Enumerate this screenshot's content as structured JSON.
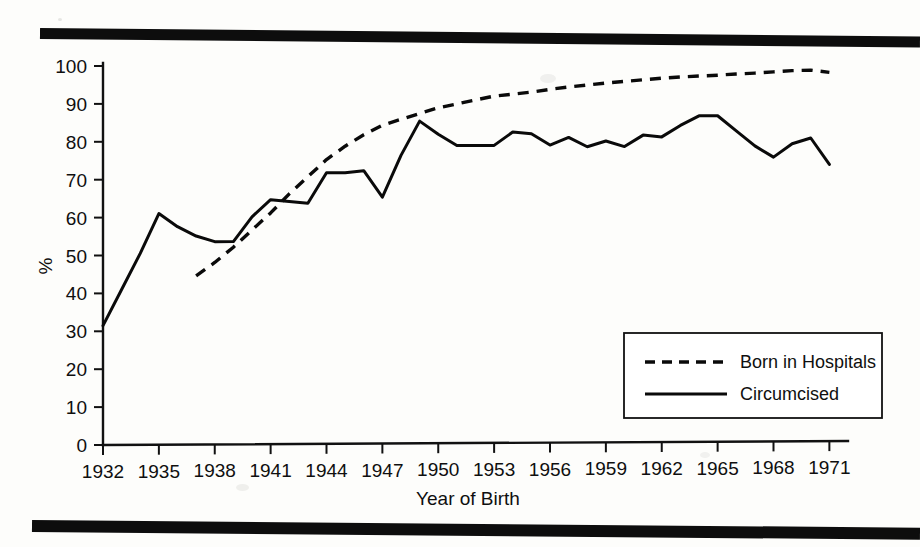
{
  "figure": {
    "background_color": "#fdfdfb",
    "ink_color": "#0a0a0a",
    "percent_symbol": "%",
    "top_rule": "scan-rule",
    "bottom_rule": "scan-rule"
  },
  "chart_data": {
    "type": "line",
    "title": "",
    "xlabel": "Year of Birth",
    "ylabel": "%",
    "xlim": [
      1932,
      1972
    ],
    "ylim": [
      0,
      100
    ],
    "grid": false,
    "legend_position": "lower-right-inside",
    "x_ticks": [
      1932,
      1935,
      1938,
      1941,
      1944,
      1947,
      1950,
      1953,
      1956,
      1959,
      1962,
      1965,
      1968,
      1971
    ],
    "y_ticks": [
      0,
      10,
      20,
      30,
      40,
      50,
      60,
      70,
      80,
      90,
      100
    ],
    "series": [
      {
        "name": "Born in Hospitals",
        "style": "dashed",
        "x": [
          1937,
          1938,
          1939,
          1940,
          1941,
          1942,
          1943,
          1944,
          1945,
          1946,
          1947,
          1948,
          1949,
          1950,
          1951,
          1952,
          1953,
          1954,
          1955,
          1956,
          1957,
          1958,
          1959,
          1960,
          1961,
          1962,
          1963,
          1964,
          1965,
          1966,
          1967,
          1968,
          1969,
          1970,
          1971
        ],
        "values": [
          44.5,
          48.0,
          52.0,
          56.5,
          61.0,
          66.0,
          70.5,
          75.0,
          78.5,
          81.5,
          84.0,
          85.5,
          87.0,
          88.5,
          89.5,
          90.5,
          91.5,
          92.0,
          92.5,
          93.2,
          93.8,
          94.3,
          94.8,
          95.2,
          95.6,
          96.0,
          96.3,
          96.5,
          96.7,
          97.0,
          97.2,
          97.5,
          97.8,
          97.9,
          97.3
        ]
      },
      {
        "name": "Circumcised",
        "style": "solid",
        "x": [
          1932,
          1933,
          1934,
          1935,
          1936,
          1937,
          1938,
          1939,
          1940,
          1941,
          1942,
          1943,
          1944,
          1945,
          1946,
          1947,
          1948,
          1949,
          1950,
          1951,
          1952,
          1953,
          1954,
          1955,
          1956,
          1957,
          1958,
          1959,
          1960,
          1961,
          1962,
          1963,
          1964,
          1965,
          1966,
          1967,
          1968,
          1969,
          1970,
          1971
        ],
        "values": [
          31.5,
          41.0,
          50.5,
          61.0,
          57.5,
          55.0,
          53.5,
          53.5,
          60.0,
          64.5,
          64.0,
          63.5,
          71.5,
          71.5,
          72.0,
          65.0,
          76.0,
          85.0,
          81.5,
          78.5,
          78.5,
          78.5,
          82.0,
          81.5,
          78.5,
          80.5,
          78.0,
          79.5,
          78.0,
          81.0,
          80.5,
          83.5,
          86.0,
          86.0,
          82.0,
          78.0,
          75.0,
          78.5,
          80.0,
          73.0
        ]
      }
    ]
  },
  "legend": {
    "entries": [
      {
        "label": "Born in Hospitals",
        "style": "dashed"
      },
      {
        "label": "Circumcised",
        "style": "solid"
      }
    ]
  },
  "axis_labels": {
    "x_title": "Year of Birth",
    "y_title": "%",
    "x_tick_labels": [
      "1932",
      "1935",
      "1938",
      "1941",
      "1944",
      "1947",
      "1950",
      "1953",
      "1956",
      "1959",
      "1962",
      "1965",
      "1968",
      "1971"
    ],
    "y_tick_labels": [
      "100",
      "90",
      "80",
      "70",
      "60",
      "50",
      "40",
      "30",
      "20",
      "10",
      "0"
    ]
  }
}
